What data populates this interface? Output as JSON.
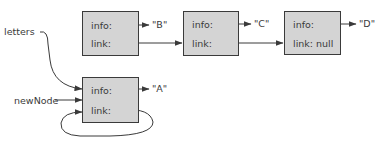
{
  "diagram": {
    "type": "linked-list-insertion",
    "external_refs": {
      "letters": "letters",
      "newNode": "newNode"
    },
    "nodes": [
      {
        "id": "A",
        "info_label": "info:",
        "link_label": "link:",
        "value": "\"A\""
      },
      {
        "id": "B",
        "info_label": "info:",
        "link_label": "link:",
        "value": "\"B\""
      },
      {
        "id": "C",
        "info_label": "info:",
        "link_label": "link:",
        "value": "\"C\""
      },
      {
        "id": "D",
        "info_label": "info:",
        "link_label": "link: null",
        "value": "\"D\""
      }
    ],
    "edges": [
      {
        "from": "letters",
        "to": "A"
      },
      {
        "from": "newNode",
        "to": "A"
      },
      {
        "from": "A.link",
        "to": "A"
      },
      {
        "from": "B.link",
        "to": "C"
      },
      {
        "from": "C.link",
        "to": "D"
      }
    ],
    "colors": {
      "node_fill": "#d4d4d4",
      "stroke": "#3a3a3a",
      "background": "#ffffff"
    }
  }
}
